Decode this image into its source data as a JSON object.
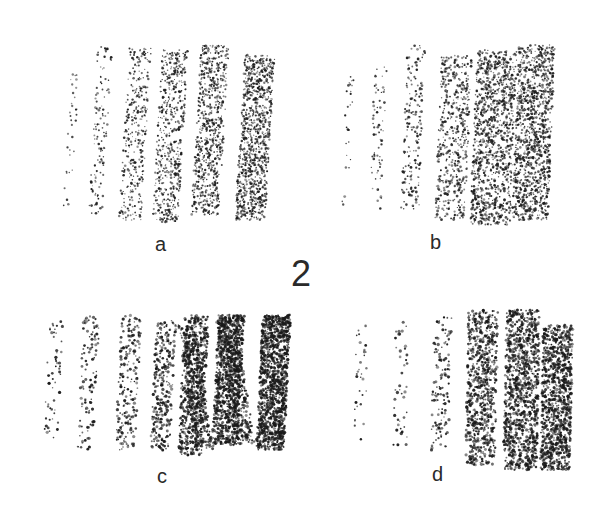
{
  "figure": {
    "number": "2",
    "panels": [
      {
        "id": "a",
        "label": "a",
        "description": "pencil hatching strokes, graded light to dark, left to right"
      },
      {
        "id": "b",
        "label": "b",
        "description": "pencil hatching strokes, soft blended gradation light to dark"
      },
      {
        "id": "c",
        "label": "c",
        "description": "charcoal zigzag strokes, graded light to very dark"
      },
      {
        "id": "d",
        "label": "d",
        "description": "charcoal stippled texture, graded light to dark"
      }
    ]
  },
  "colors": {
    "background": "#ffffff",
    "ink": "#2a2a2a"
  }
}
